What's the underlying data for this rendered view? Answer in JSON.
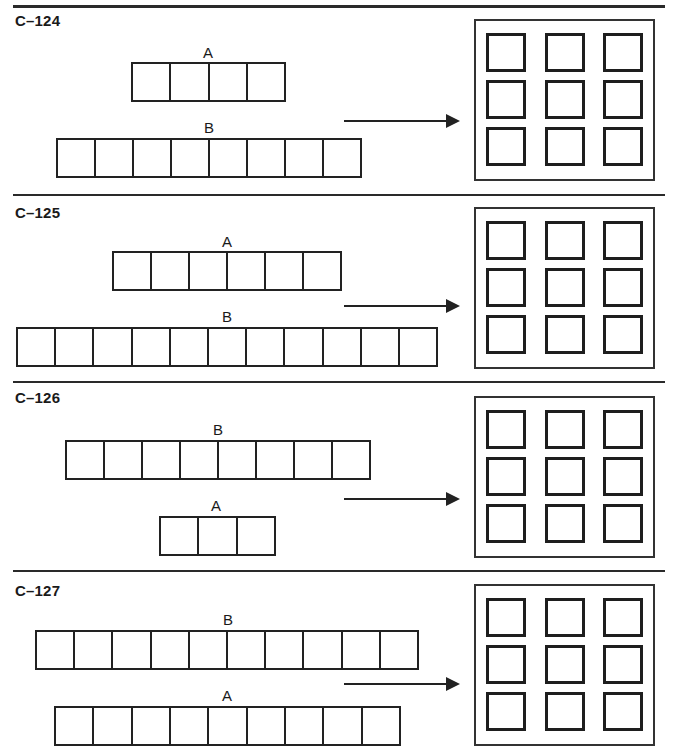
{
  "page": {
    "problems": [
      {
        "id": "C–124",
        "top_bar": {
          "label": "A",
          "cells": 4
        },
        "bottom_bar": {
          "label": "B",
          "cells": 8
        },
        "answer_grid": {
          "rows": 3,
          "cols": 3
        }
      },
      {
        "id": "C–125",
        "top_bar": {
          "label": "A",
          "cells": 6
        },
        "bottom_bar": {
          "label": "B",
          "cells": 11
        },
        "answer_grid": {
          "rows": 3,
          "cols": 3
        }
      },
      {
        "id": "C–126",
        "top_bar": {
          "label": "B",
          "cells": 8
        },
        "bottom_bar": {
          "label": "A",
          "cells": 3
        },
        "answer_grid": {
          "rows": 3,
          "cols": 3
        }
      },
      {
        "id": "C–127",
        "top_bar": {
          "label": "B",
          "cells": 10
        },
        "bottom_bar": {
          "label": "A",
          "cells": 9
        },
        "answer_grid": {
          "rows": 3,
          "cols": 3
        }
      }
    ],
    "colors": {
      "ink": "#222222",
      "paper": "#ffffff"
    }
  }
}
